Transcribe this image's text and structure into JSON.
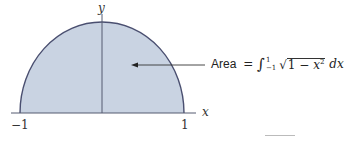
{
  "figure": {
    "type": "semicircle-area-diagram",
    "fill_color": "#c9d3e2",
    "stroke_color": "#4a4f70",
    "axis_color": "#555b70",
    "axes": {
      "x_label": "x",
      "y_label": "y",
      "x_ticks": [
        "−1",
        "1"
      ]
    },
    "annotation": {
      "word": "Area",
      "equals": " = ",
      "integral_sign": "∫",
      "upper_limit": "1",
      "lower_limit": "−1",
      "sqrt_sign": "√",
      "radicand_prefix": "1 − ",
      "radicand_var": "x",
      "radicand_exp": "2",
      "differential": " dx"
    }
  }
}
